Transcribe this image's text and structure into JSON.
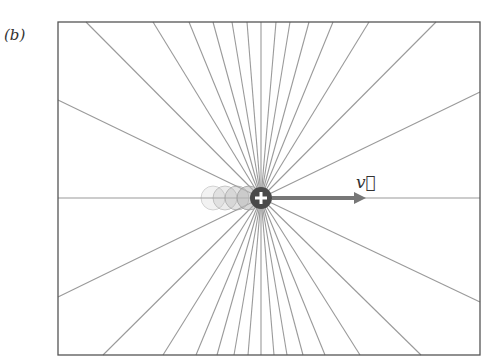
{
  "panel": {
    "label": "(b)"
  },
  "figure": {
    "frame": {
      "left": 58,
      "top": 22,
      "right": 480,
      "bottom": 355,
      "stroke": "#555555"
    },
    "charge": {
      "cx": 261,
      "cy": 198,
      "r": 11,
      "symbol": "+",
      "fill": "#4a4a4a",
      "sign": "positive"
    },
    "ghost_charges": [
      {
        "cx": 213,
        "cy": 198,
        "opacity": 0.18
      },
      {
        "cx": 225,
        "cy": 198,
        "opacity": 0.28
      },
      {
        "cx": 237,
        "cy": 198,
        "opacity": 0.4
      },
      {
        "cx": 249,
        "cy": 198,
        "opacity": 0.55
      }
    ],
    "velocity_arrow": {
      "x1": 272,
      "y1": 198,
      "x2": 366,
      "y2": 198,
      "color": "#777777",
      "label": "v⃗"
    },
    "field_line_color": "#9a9a9a",
    "field_line_endpoints": {
      "top": [
        86,
        153,
        189,
        213,
        232,
        247,
        261,
        276,
        290,
        309,
        333,
        369,
        436
      ],
      "bottom": [
        103,
        163,
        196,
        217,
        234,
        248,
        261,
        274,
        287,
        303,
        325,
        360,
        421
      ],
      "left": [
        100,
        198,
        297
      ],
      "right": [
        92,
        198,
        302
      ]
    }
  }
}
